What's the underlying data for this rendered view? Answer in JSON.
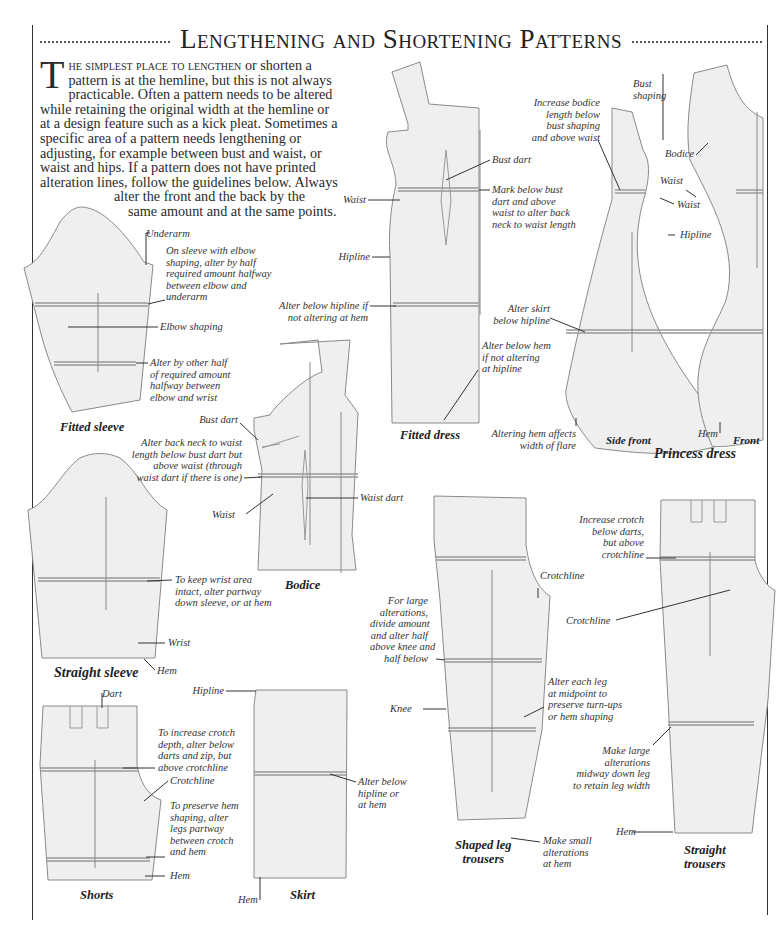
{
  "header": {
    "title": "Lengthening and Shortening Patterns"
  },
  "intro": {
    "drop_cap": "T",
    "lead_in": "he simplest place to lengthen",
    "line1_rest": " or shorten a",
    "line2": "pattern is at the hemline, but this is not always",
    "line3": "practicable. Often a pattern needs to be altered",
    "line4": "while retaining the original width at the hemline or",
    "line5": "at a design feature such as a kick pleat. Sometimes a",
    "line6": "specific area of a pattern needs lengthening or",
    "line7": "adjusting, for example between bust and waist, or",
    "line8": "waist and hips. If a pattern does not have printed",
    "line9": "alteration lines, follow the guidelines below. Always",
    "line10": "alter the front and the back by the",
    "line11": "same amount and at the same points."
  },
  "diagrams": {
    "fitted_sleeve": {
      "caption": "Fitted sleeve",
      "labels": {
        "underarm": "Underarm",
        "elbow_note": [
          "On sleeve with elbow",
          "shaping, alter by half",
          "required amount halfway",
          "between elbow and",
          "underarm"
        ],
        "elbow_shaping": "Elbow shaping",
        "other_half": [
          "Alter by other half",
          "of required amount",
          "halfway between",
          "elbow and wrist"
        ]
      }
    },
    "bodice": {
      "caption": "Bodice",
      "labels": {
        "bust_dart": "Bust dart",
        "back_neck": [
          "Alter back neck to waist",
          "length below bust dart but",
          "above waist (through",
          "waist dart if there is one)"
        ],
        "waist": "Waist",
        "waist_dart": "Waist dart"
      }
    },
    "straight_sleeve": {
      "caption": "Straight sleeve",
      "labels": {
        "keep_wrist": [
          "To keep wrist area",
          "intact, alter partway",
          "down sleeve, or at hem"
        ],
        "wrist": "Wrist",
        "hem": "Hem"
      }
    },
    "shorts": {
      "caption": "Shorts",
      "labels": {
        "dart": "Dart",
        "crotch_depth": [
          "To increase crotch",
          "depth, alter below",
          "darts and zip, but",
          "above crotchline"
        ],
        "crotchline": "Crotchline",
        "preserve_hem": [
          "To preserve hem",
          "shaping, alter",
          "legs partway",
          "between crotch",
          "and hem"
        ],
        "hem": "Hem"
      }
    },
    "skirt": {
      "caption": "Skirt",
      "labels": {
        "hipline": "Hipline",
        "alter_below": [
          "Alter below",
          "hipline or",
          "at hem"
        ],
        "hem": "Hem"
      }
    },
    "fitted_dress": {
      "caption": "Fitted dress",
      "labels": {
        "waist": "Waist",
        "hipline": "Hipline",
        "bust_dart": "Bust dart",
        "mark_below": [
          "Mark below bust",
          "dart and above",
          "waist to alter back",
          "neck to waist length"
        ],
        "alter_hipline": [
          "Alter below hipline if",
          "not altering at hem"
        ],
        "alter_hem": [
          "Alter below hem",
          "if not altering",
          "at hipline"
        ]
      }
    },
    "princess_dress": {
      "caption": "Princess dress",
      "side_front_caption": "Side front",
      "front_caption": "Front",
      "labels": {
        "bust_shaping": [
          "Bust",
          "shaping"
        ],
        "increase_bodice": [
          "Increase bodice",
          "length below",
          "bust shaping",
          "and above waist"
        ],
        "bodice": "Bodice",
        "waist_front": "Waist",
        "waist_side": "Waist",
        "hipline": "Hipline",
        "alter_skirt": [
          "Alter skirt",
          "below hipline"
        ],
        "altering_hem": [
          "Altering hem affects",
          "width of flare"
        ],
        "hem": "Hem"
      }
    },
    "shaped_leg_trousers": {
      "caption": [
        "Shaped leg",
        "trousers"
      ],
      "labels": {
        "crotchline": "Crotchline",
        "large_alterations": [
          "For large",
          "alterations,",
          "divide amount",
          "and alter half",
          "above knee and",
          "half below"
        ],
        "knee": "Knee",
        "alter_each_leg": [
          "Alter each leg",
          "at midpoint to",
          "preserve turn-ups",
          "or hem shaping"
        ],
        "small_alterations": [
          "Make small",
          "alterations",
          "at hem"
        ]
      }
    },
    "straight_trousers": {
      "caption": [
        "Straight",
        "trousers"
      ],
      "labels": {
        "increase_crotch": [
          "Increase crotch",
          "below darts,",
          "but above",
          "crotchline"
        ],
        "crotchline": "Crotchline",
        "large_alterations": [
          "Make large",
          "alterations",
          "midway down leg",
          "to retain leg width"
        ],
        "hem": "Hem"
      }
    }
  },
  "colors": {
    "pattern_fill": "#efefef",
    "pattern_line": "#8a8a8a",
    "alteration_line": "#9a9a9a",
    "text": "#2a2a2a"
  }
}
